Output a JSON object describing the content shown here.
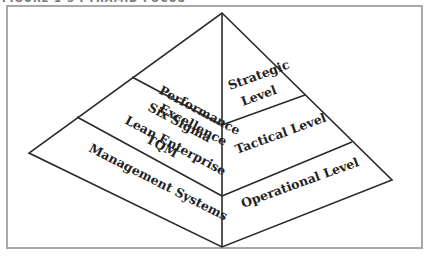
{
  "figure": {
    "caption": "FIGURE 1-5 PYRAMID FOCUS"
  },
  "diagram": {
    "type": "pyramid",
    "colors": {
      "line": "#2a2a2a",
      "frame": "#a8a8a8",
      "text": "#222222"
    },
    "left_face": {
      "tiers": [
        {
          "lines": [
            "Performance",
            "Excellence"
          ]
        },
        {
          "lines": [
            "Six Sigma",
            "Lean Enterprise",
            "TQM"
          ]
        },
        {
          "lines": [
            "Management Systems"
          ]
        }
      ]
    },
    "right_face": {
      "tiers": [
        {
          "lines": [
            "Strategic",
            "Level"
          ]
        },
        {
          "lines": [
            "Tactical Level"
          ]
        },
        {
          "lines": [
            "Operational Level"
          ]
        }
      ]
    }
  }
}
